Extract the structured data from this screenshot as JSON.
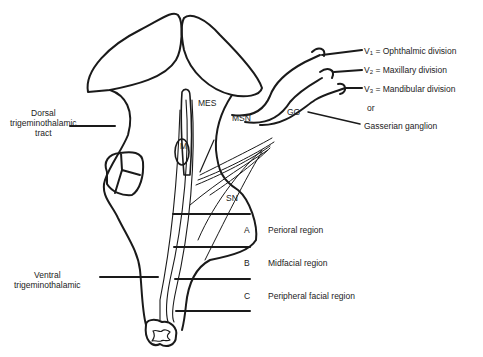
{
  "figure": {
    "left_labels": {
      "dorsal": [
        "Dorsal",
        "trigeminothalamic",
        "tract"
      ],
      "ventral": [
        "Ventral",
        "trigeminothalamic"
      ]
    },
    "nuclei": {
      "mes": "MES",
      "msn": "MSN",
      "m": "M",
      "sn": "SN",
      "gg": "GG"
    },
    "divisions": [
      {
        "prefix": "V",
        "sub": "1",
        "text": " = Ophthalmic division"
      },
      {
        "prefix": "V",
        "sub": "2",
        "text": " = Maxillary division"
      },
      {
        "prefix": "V",
        "sub": "3",
        "text": " = Mandibular division"
      }
    ],
    "or_text": "or",
    "ganglion": "Gasserian ganglion",
    "regions": [
      {
        "letter": "A",
        "name": "Perioral region"
      },
      {
        "letter": "B",
        "name": "Midfacial region"
      },
      {
        "letter": "C",
        "name": "Peripheral facial region"
      }
    ]
  }
}
